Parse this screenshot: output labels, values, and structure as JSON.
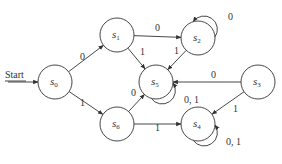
{
  "diagram": {
    "type": "finite-state-machine",
    "start_label": "Start",
    "states": [
      {
        "id": "s0",
        "base": "s",
        "sub": "0"
      },
      {
        "id": "s1",
        "base": "s",
        "sub": "1"
      },
      {
        "id": "s2",
        "base": "s",
        "sub": "2"
      },
      {
        "id": "s3",
        "base": "s",
        "sub": "3"
      },
      {
        "id": "s4",
        "base": "s",
        "sub": "4"
      },
      {
        "id": "s5",
        "base": "s",
        "sub": "5"
      },
      {
        "id": "s6",
        "base": "s",
        "sub": "6"
      }
    ],
    "transitions": [
      {
        "from": "s0",
        "to": "s1",
        "label": "0"
      },
      {
        "from": "s0",
        "to": "s6",
        "label": "1"
      },
      {
        "from": "s1",
        "to": "s2",
        "label": "0"
      },
      {
        "from": "s1",
        "to": "s5",
        "label": "1"
      },
      {
        "from": "s2",
        "to": "s2",
        "label": "0"
      },
      {
        "from": "s2",
        "to": "s5",
        "label": "1"
      },
      {
        "from": "s3",
        "to": "s5",
        "label": "0"
      },
      {
        "from": "s3",
        "to": "s4",
        "label": "1"
      },
      {
        "from": "s5",
        "to": "s5",
        "label": "0, 1"
      },
      {
        "from": "s6",
        "to": "s5",
        "label": "0"
      },
      {
        "from": "s6",
        "to": "s4",
        "label": "1"
      },
      {
        "from": "s4",
        "to": "s4",
        "label": "0, 1"
      }
    ]
  }
}
